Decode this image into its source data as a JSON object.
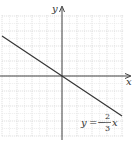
{
  "diagram": {
    "axes": {
      "x_label": "x",
      "y_label": "y"
    },
    "equation": {
      "lhs": "y",
      "equals": "=",
      "sign": "−",
      "numerator": "2",
      "denominator": "3",
      "variable": "x"
    },
    "colors": {
      "line": "#333333",
      "axis": "#444444",
      "grid": "#d9d9d9",
      "background": "#ffffff"
    }
  },
  "chart_data": {
    "type": "line",
    "title": "",
    "equation": "y = -2/3 x",
    "xlabel": "x",
    "ylabel": "y",
    "series": [
      {
        "name": "y = -2/3 x",
        "x": [
          -8,
          0,
          8
        ],
        "y": [
          5.33,
          0,
          -5.33
        ]
      }
    ],
    "slope": -0.6667,
    "intercept": 0,
    "grid": true,
    "xlim": [
      -8,
      8
    ],
    "ylim": [
      -8,
      8
    ]
  }
}
